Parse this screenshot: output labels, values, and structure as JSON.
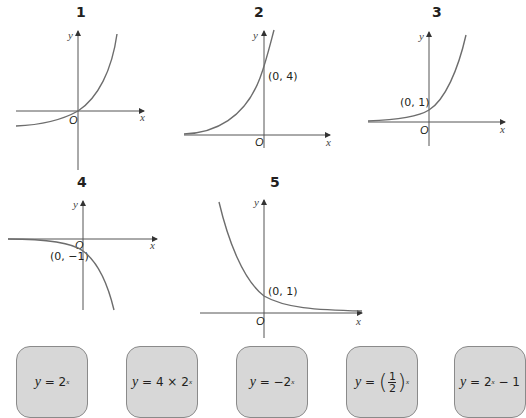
{
  "graphs": [
    {
      "number": "1",
      "x_axis": "x",
      "y_axis": "y",
      "origin": "O",
      "point_label": "",
      "equation": "y = 2^x - 1"
    },
    {
      "number": "2",
      "x_axis": "x",
      "y_axis": "y",
      "origin": "O",
      "point_label": "(0, 4)",
      "equation": "y = 4 × 2^x"
    },
    {
      "number": "3",
      "x_axis": "x",
      "y_axis": "y",
      "origin": "O",
      "point_label": "(0, 1)",
      "equation": "y = 2^x"
    },
    {
      "number": "4",
      "x_axis": "x",
      "y_axis": "y",
      "origin": "O",
      "point_label": "(0, −1)",
      "equation": "y = -2^x"
    },
    {
      "number": "5",
      "x_axis": "x",
      "y_axis": "y",
      "origin": "O",
      "point_label": "(0, 1)",
      "equation": "y = (1/2)^x"
    }
  ],
  "cards": [
    {
      "lhs": "y",
      "eq": " = ",
      "base": "2",
      "exp": "x",
      "tail": ""
    },
    {
      "lhs": "y",
      "eq": " = 4 × ",
      "base": "2",
      "exp": "x",
      "tail": ""
    },
    {
      "lhs": "y",
      "eq": " = −",
      "base": "2",
      "exp": "x",
      "tail": ""
    },
    {
      "lhs": "y",
      "eq": " = ",
      "num": "1",
      "den": "2",
      "exp": "x"
    },
    {
      "lhs": "y",
      "eq": " = ",
      "base": "2",
      "exp": "x",
      "tail": " − 1"
    }
  ]
}
